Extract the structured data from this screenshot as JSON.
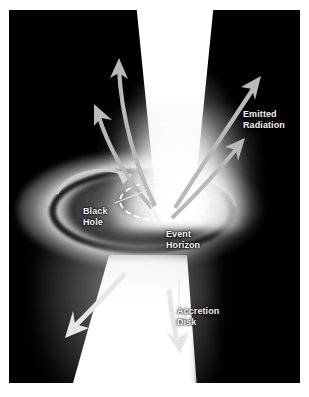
{
  "figure": {
    "background_color": "#ffffff",
    "panel_color": "#000000",
    "label_color": "#f2f2f2",
    "width": 309,
    "height": 397
  },
  "labels": {
    "black_hole": "Black\nHole",
    "event_horizon": "Event\nHorizon",
    "emitted_radiation": "Emitted\nRadiation",
    "accretion_disk": "Accretion\nDisk"
  },
  "diagram": {
    "components": [
      {
        "name": "black-hole",
        "label": "Black Hole",
        "shape": "filled-ellipse",
        "color": "#000000"
      },
      {
        "name": "event-horizon",
        "label": "Event Horizon",
        "shape": "dashed-ellipse",
        "color": "#ffffff"
      },
      {
        "name": "accretion-disk",
        "label": "Accretion Disk",
        "shape": "ring-ellipse",
        "color": "#d8d8d8"
      },
      {
        "name": "jet-upper",
        "label": "Upper Relativistic Jet",
        "shape": "cone",
        "color": "#ffffff"
      },
      {
        "name": "jet-lower",
        "label": "Lower Relativistic Jet",
        "shape": "cone",
        "color": "#ffffff"
      },
      {
        "name": "emitted-radiation",
        "label": "Emitted Radiation",
        "shape": "arrows",
        "color": "#b9b9b9"
      }
    ],
    "arrow_count_upper_left": 2,
    "arrow_count_upper_right": 2,
    "arrow_count_lower": 2,
    "rotation_arrow": 1
  }
}
